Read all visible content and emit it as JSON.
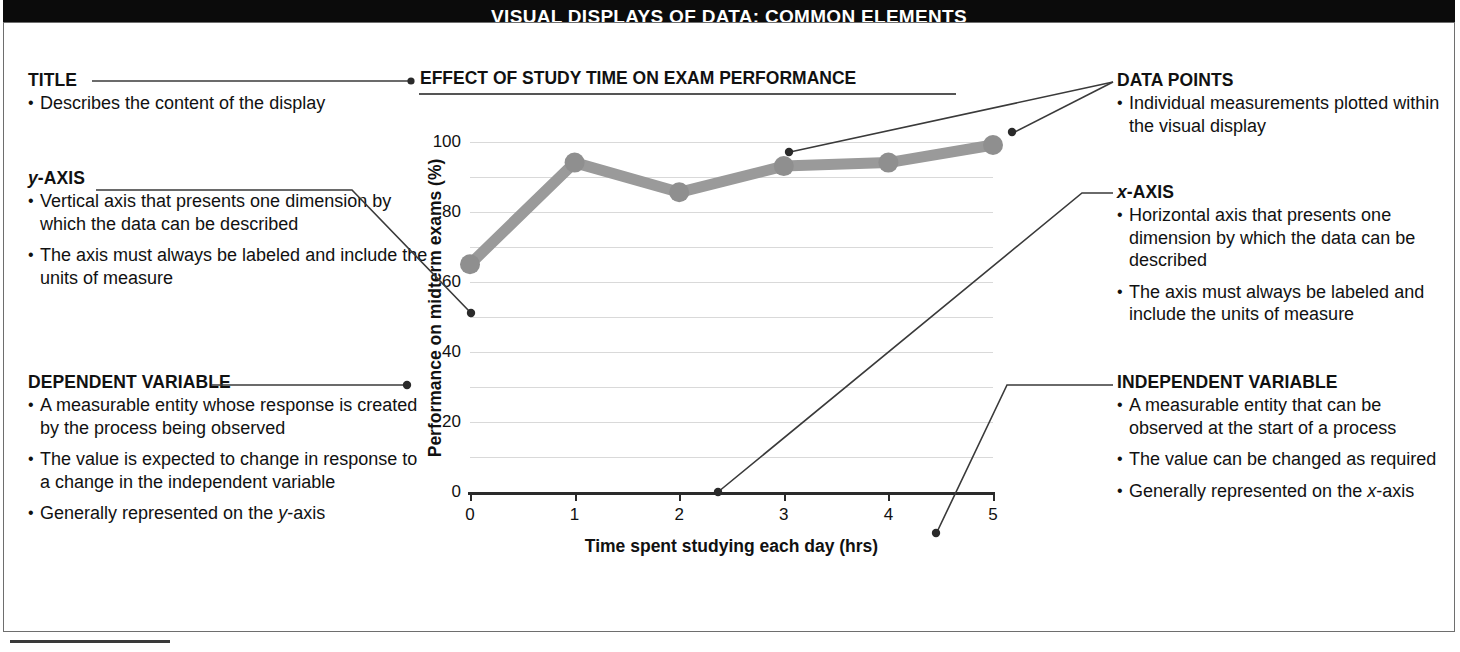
{
  "header": {
    "title": "VISUAL DISPLAYS OF DATA: COMMON ELEMENTS"
  },
  "ghost_text": "A Statistics can help us in making",
  "left_column": [
    {
      "heading": "TITLE",
      "bullets": [
        "Describes the content of the display"
      ]
    },
    {
      "heading": "y-AXIS",
      "heading_italic_prefix": "y",
      "heading_rest": "-AXIS",
      "bullets": [
        "Vertical axis that presents one dimension by which the data can be described",
        "The axis must always be labeled and include the units of measure"
      ]
    },
    {
      "heading": "DEPENDENT VARIABLE",
      "bullets": [
        "A measurable entity whose response is created by the process being observed",
        "The value is expected to change in response to a change in the independent variable",
        "Generally represented on the y-axis"
      ]
    }
  ],
  "right_column": [
    {
      "heading": "DATA POINTS",
      "bullets": [
        "Individual measurements plotted within the visual display"
      ]
    },
    {
      "heading": "x-AXIS",
      "heading_italic_prefix": "x",
      "heading_rest": "-AXIS",
      "bullets": [
        "Horizontal axis that presents one dimension by which the data can be described",
        "The axis must always be labeled and include the units of measure"
      ]
    },
    {
      "heading": "INDEPENDENT VARIABLE",
      "bullets": [
        "A measurable entity that can be observed at the start of a process",
        "The value can be changed as required",
        "Generally represented on the x-axis"
      ]
    }
  ],
  "chart_data": {
    "type": "line",
    "title": "EFFECT OF STUDY TIME ON EXAM PERFORMANCE",
    "xlabel": "Time spent studying each day (hrs)",
    "ylabel": "Performance on midterm exams (%)",
    "x": [
      0,
      1,
      2,
      3,
      4,
      5
    ],
    "values": [
      65,
      94,
      85.5,
      93,
      94,
      99
    ],
    "series": [
      {
        "name": "Performance on midterm exams (%)",
        "values": [
          65,
          94,
          85.5,
          93,
          94,
          99
        ]
      }
    ],
    "xlim": [
      0,
      5
    ],
    "ylim": [
      0,
      105
    ],
    "xticks": [
      "0",
      "1",
      "2",
      "3",
      "4",
      "5"
    ],
    "yticks": [
      "0",
      "20",
      "40",
      "60",
      "80",
      "100"
    ],
    "gridline_values": [
      0,
      10,
      20,
      30,
      40,
      50,
      60,
      70,
      80,
      90,
      100
    ],
    "grid": true,
    "legend": "none",
    "series_color": "#9a9a9a",
    "marker_color": "#8f8f8f",
    "grid_color": "#d9d9d9",
    "axis_color": "#2a2a2a"
  }
}
